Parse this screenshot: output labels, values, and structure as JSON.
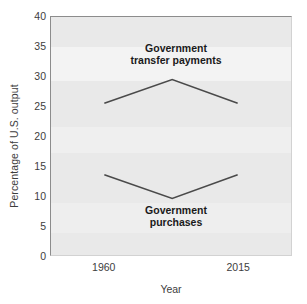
{
  "chart_data": {
    "type": "line",
    "title": "",
    "xlabel": "Year",
    "ylabel": "Percentage of U.S. output",
    "xlim": [
      1938,
      2037
    ],
    "ylim": [
      0,
      40
    ],
    "grid": false,
    "legend_position": "inline-annotation",
    "x_tick_labels": [
      "1960",
      "2015"
    ],
    "x_tick_values": [
      1960,
      2015
    ],
    "y_tick_labels": [
      "0",
      "5",
      "10",
      "15",
      "20",
      "25",
      "30",
      "35",
      "40"
    ],
    "y_tick_values": [
      0,
      5,
      10,
      15,
      20,
      25,
      30,
      35,
      40
    ],
    "series": [
      {
        "name": "Government transfer payments",
        "x": [
          1960,
          1988,
          2015
        ],
        "values": [
          25.5,
          29.5,
          25.5
        ],
        "color": "#4a4a4a",
        "annotation": "Government\ntransfer payments"
      },
      {
        "name": "Government purchases",
        "x": [
          1960,
          1988,
          2015
        ],
        "values": [
          13.5,
          9.5,
          13.5
        ],
        "color": "#4a4a4a",
        "annotation": "Government\npurchases"
      }
    ]
  },
  "axes": {
    "y_title": "Percentage of U.S. output",
    "x_title": "Year"
  },
  "colors": {
    "plot_background": "#e9e9e9",
    "axis_line": "#8c8c8c",
    "series_line": "#4a4a4a",
    "text": "#3d3d3d",
    "annotation_text": "#1a1a1a"
  },
  "annotations": {
    "transfer_payments": "Government\ntransfer payments",
    "purchases": "Government\npurchases"
  }
}
